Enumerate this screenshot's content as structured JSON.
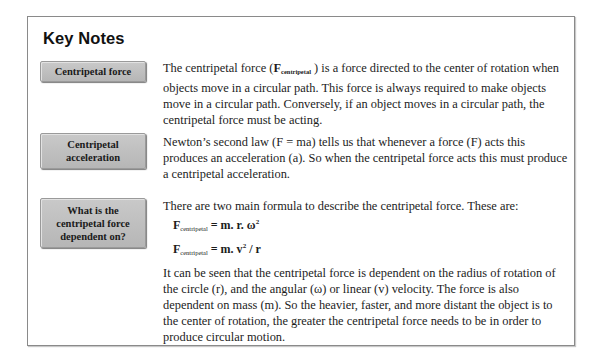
{
  "title": "Key Notes",
  "sections": [
    {
      "label": "Centripetal force",
      "text_before": "The centripetal force (",
      "symbol": "F",
      "symbol_sub": "centripetal",
      "text_after": " ) is a force directed to the center of rotation when objects move in a circular path. This force is always required to make objects move in a circular path. Conversely, if an object moves in a circular path, the centripetal force must be acting."
    },
    {
      "label": "Centripetal acceleration",
      "text": "Newton’s second law (F = ma) tells us that whenever a force (F) acts this produces an acceleration (a). So when the centripetal force acts this must produce a centripetal acceleration."
    },
    {
      "label": "What is the centripetal force dependent on?",
      "intro": "There are two main formula to describe the centripetal force. These are:",
      "formulas": [
        {
          "lhs": "F",
          "lhs_sub": "centripetal",
          "rhs": " = m. r. ω",
          "sup": "2",
          "tail": ""
        },
        {
          "lhs": "F",
          "lhs_sub": "centripetal",
          "rhs": " = m. v",
          "sup": "2",
          "tail": " / r"
        }
      ],
      "conclusion": "It can be seen that the centripetal force is dependent on the radius of rotation of the circle (r), and the angular (ω) or linear (v) velocity. The force is also dependent on mass (m). So the heavier, faster, and more distant the object is to the center of rotation, the greater the centripetal force needs to be in order to produce circular motion."
    }
  ]
}
